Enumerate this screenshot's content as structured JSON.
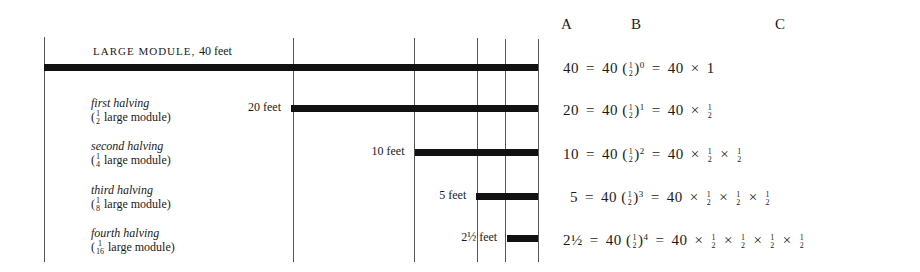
{
  "title": {
    "main": "LARGE MODULE,",
    "feet": "40 feet"
  },
  "headers": {
    "a": "A",
    "b": "B",
    "c": "C"
  },
  "rows": [
    {
      "name": "large-module",
      "label": "",
      "sublabel": "",
      "length_label": "",
      "length_feet": 40,
      "a": "40",
      "b_base": "40",
      "b_exp": "0",
      "c": "40 × 1",
      "halves": 0
    },
    {
      "name": "first-halving",
      "label": "first halving",
      "sublabel_pre": "(",
      "sublabel_num": "1",
      "sublabel_den": "2",
      "sublabel_post": " large module)",
      "length_label": "20 feet",
      "length_feet": 20,
      "a": "20",
      "b_base": "40",
      "b_exp": "1",
      "halves": 1
    },
    {
      "name": "second-halving",
      "label": "second halving",
      "sublabel_pre": "(",
      "sublabel_num": "1",
      "sublabel_den": "4",
      "sublabel_post": " large module)",
      "length_label": "10 feet",
      "length_feet": 10,
      "a": "10",
      "b_base": "40",
      "b_exp": "2",
      "halves": 2
    },
    {
      "name": "third-halving",
      "label": "third halving",
      "sublabel_pre": "(",
      "sublabel_num": "1",
      "sublabel_den": "8",
      "sublabel_post": " large module)",
      "length_label": "5 feet",
      "length_feet": 5,
      "a": "5",
      "b_base": "40",
      "b_exp": "3",
      "halves": 3
    },
    {
      "name": "fourth-halving",
      "label": "fourth halving",
      "sublabel_pre": "(",
      "sublabel_num": "1",
      "sublabel_den": "16",
      "sublabel_post": " large module)",
      "length_label": "2½ feet",
      "length_feet": 2.5,
      "a": "2½",
      "b_base": "40",
      "b_exp": "4",
      "halves": 4
    }
  ],
  "symbols": {
    "equals": "=",
    "times": "×",
    "one": "1",
    "half_num": "1",
    "half_den": "2",
    "c_base": "40"
  },
  "max_feet": 40
}
